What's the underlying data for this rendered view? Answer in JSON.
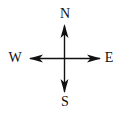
{
  "diagram": {
    "type": "compass-rose",
    "directions": {
      "north": "N",
      "south": "S",
      "east": "E",
      "west": "W"
    },
    "colors": {
      "stroke": "#111111",
      "background": "#ffffff"
    }
  }
}
